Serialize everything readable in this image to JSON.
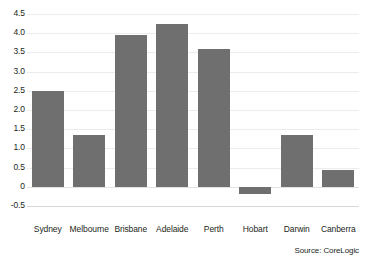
{
  "chart_data": {
    "type": "bar",
    "title": "",
    "subtitle": "",
    "xlabel": "",
    "ylabel": "",
    "categories": [
      "Sydney",
      "Melbourne",
      "Brisbane",
      "Adelaide",
      "Perth",
      "Hobart",
      "Darwin",
      "Canberra"
    ],
    "values": [
      2.5,
      1.35,
      3.95,
      4.25,
      3.6,
      -0.2,
      1.35,
      0.45
    ],
    "series": [
      {
        "name": "",
        "values": [
          2.5,
          1.35,
          3.95,
          4.25,
          3.6,
          -0.2,
          1.35,
          0.45
        ]
      }
    ],
    "ylim": [
      -0.5,
      4.5
    ],
    "ytick_values": [
      4.5,
      4.0,
      3.5,
      3.0,
      2.5,
      2.0,
      1.5,
      1.0,
      0.5,
      0,
      -0.5
    ],
    "ytick_labels": [
      "4.5",
      "4.0",
      "3.5",
      "3.0",
      "2.5",
      "2.0",
      "1.5",
      "1.0",
      "0.5",
      "0",
      "-0.5"
    ],
    "grid": true,
    "grid_axis": "y",
    "legend": false,
    "legend_position": "none",
    "bar_color": "#6f6f6f",
    "gridline_color": "#ececed",
    "background_color": "#ffffff",
    "text_color": "#231f20",
    "annotations": [
      "Source: CoreLogic"
    ]
  },
  "source": {
    "label": "Source: CoreLogic"
  }
}
